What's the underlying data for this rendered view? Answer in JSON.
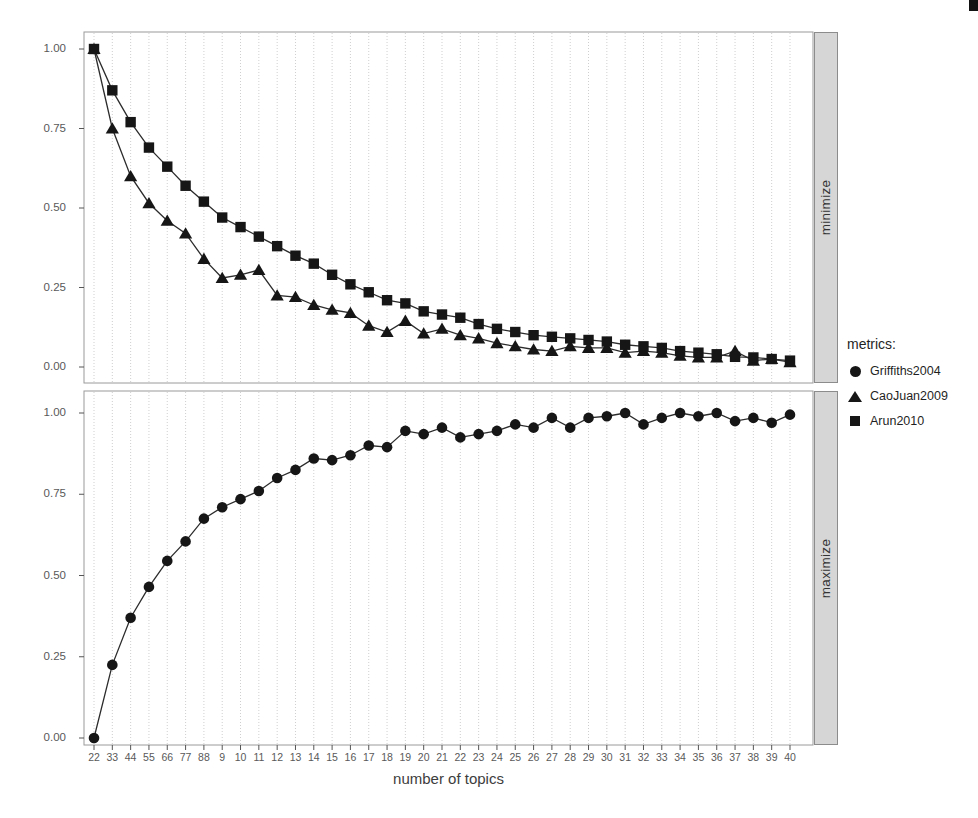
{
  "chart_data": {
    "type": "line",
    "title": "",
    "xlabel": "number of topics",
    "ylabel": "",
    "ylim": [
      0,
      1
    ],
    "y_ticks": [
      0,
      0.25,
      0.5,
      0.75,
      1
    ],
    "y_tick_labels": [
      "0.00",
      "0.25",
      "0.50",
      "0.75",
      "1.00"
    ],
    "grid": "vertical-only",
    "legend_position": "right",
    "x": [
      2,
      3,
      4,
      5,
      6,
      7,
      8,
      9,
      10,
      11,
      12,
      13,
      14,
      15,
      16,
      17,
      18,
      19,
      20,
      21,
      22,
      23,
      24,
      25,
      26,
      27,
      28,
      29,
      30,
      31,
      32,
      33,
      34,
      35,
      36,
      37,
      38,
      39,
      40
    ],
    "x_tick_labels_printed": [
      "22",
      "33",
      "44",
      "55",
      "66",
      "77",
      "88",
      "9",
      "10",
      "11",
      "12",
      "13",
      "14",
      "15",
      "16",
      "17",
      "18",
      "19",
      "20",
      "21",
      "22",
      "23",
      "24",
      "25",
      "26",
      "27",
      "28",
      "29",
      "30",
      "31",
      "32",
      "33",
      "34",
      "35",
      "36",
      "37",
      "38",
      "39",
      "40"
    ],
    "panels": [
      {
        "strip": "minimize",
        "series": [
          {
            "name": "CaoJuan2009",
            "marker": "triangle",
            "values": [
              1.0,
              0.75,
              0.6,
              0.515,
              0.46,
              0.42,
              0.34,
              0.28,
              0.29,
              0.305,
              0.225,
              0.22,
              0.195,
              0.18,
              0.17,
              0.13,
              0.11,
              0.145,
              0.105,
              0.12,
              0.1,
              0.09,
              0.075,
              0.065,
              0.055,
              0.05,
              0.065,
              0.06,
              0.06,
              0.045,
              0.05,
              0.045,
              0.035,
              0.03,
              0.03,
              0.05,
              0.02,
              0.025,
              0.015
            ]
          },
          {
            "name": "Arun2010",
            "marker": "square",
            "values": [
              1.0,
              0.87,
              0.77,
              0.69,
              0.63,
              0.57,
              0.52,
              0.47,
              0.44,
              0.41,
              0.38,
              0.35,
              0.325,
              0.29,
              0.26,
              0.235,
              0.21,
              0.2,
              0.175,
              0.165,
              0.155,
              0.135,
              0.12,
              0.11,
              0.1,
              0.095,
              0.09,
              0.085,
              0.08,
              0.07,
              0.065,
              0.06,
              0.05,
              0.045,
              0.04,
              0.032,
              0.03,
              0.025,
              0.02
            ]
          }
        ]
      },
      {
        "strip": "maximize",
        "series": [
          {
            "name": "Griffiths2004",
            "marker": "circle",
            "values": [
              0.0,
              0.225,
              0.37,
              0.465,
              0.545,
              0.605,
              0.675,
              0.71,
              0.735,
              0.76,
              0.8,
              0.825,
              0.86,
              0.855,
              0.87,
              0.9,
              0.895,
              0.945,
              0.935,
              0.955,
              0.925,
              0.935,
              0.945,
              0.965,
              0.955,
              0.985,
              0.955,
              0.985,
              0.99,
              1.0,
              0.965,
              0.985,
              1.0,
              0.99,
              1.0,
              0.975,
              0.985,
              0.97,
              0.995
            ]
          }
        ]
      }
    ],
    "legend": {
      "title": "metrics:",
      "items": [
        {
          "label": "Griffiths2004",
          "marker": "circle"
        },
        {
          "label": "CaoJuan2009",
          "marker": "triangle"
        },
        {
          "label": "Arun2010",
          "marker": "square"
        }
      ]
    },
    "colors": {
      "line": "#2c2c2c",
      "marker": "#161616",
      "grid": "#cfcfcf",
      "panel_border": "#9a9a9a",
      "strip_background": "#d6d6d6",
      "strip_border": "#8c8c8c",
      "axis_text": "#595959",
      "title_text": "#3d3d3d",
      "legend_text": "#1f1f1f"
    }
  }
}
